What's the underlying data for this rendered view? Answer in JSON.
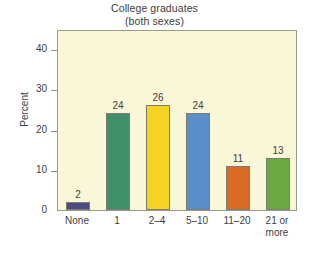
{
  "chart_data": {
    "type": "bar",
    "title": "College graduates (both sexes)",
    "title_lines": [
      "College graduates",
      "(both sexes)"
    ],
    "xlabel": "",
    "ylabel": "Percent",
    "ylim": [
      0,
      45
    ],
    "yticks": [
      0,
      10,
      20,
      30,
      40
    ],
    "ytick_labels": [
      "0",
      "10",
      "20",
      "30",
      "40"
    ],
    "grid": false,
    "legend": "none",
    "categories": [
      "None",
      "1",
      "2–4",
      "5–10",
      "11–20",
      "21 or more"
    ],
    "category_lines": [
      [
        "None"
      ],
      [
        "1"
      ],
      [
        "2–4"
      ],
      [
        "5–10"
      ],
      [
        "11–20"
      ],
      [
        "21 or",
        "more"
      ]
    ],
    "values": [
      2,
      24,
      26,
      24,
      11,
      13
    ],
    "value_labels": [
      "2",
      "24",
      "26",
      "24",
      "11",
      "13"
    ],
    "bar_colors": [
      "#4a4a82",
      "#3f8f6a",
      "#f5d322",
      "#5b8ecb",
      "#da6a26",
      "#6ba943"
    ],
    "bar_border_color": "#7c7c70",
    "plot_background": "#faf7d8",
    "plot_border_color": "#9a9a92",
    "page_background": "#ffffff",
    "text_color": "#3d3d3d"
  }
}
